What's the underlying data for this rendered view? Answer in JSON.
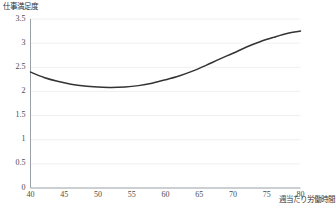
{
  "chart_data": {
    "type": "line",
    "title": "",
    "ylabel": "仕事満足度",
    "xlabel": "週当たり労働時間",
    "xlim": [
      40,
      80
    ],
    "ylim": [
      0,
      3.5
    ],
    "xticks": [
      40,
      45,
      50,
      55,
      60,
      65,
      70,
      75,
      80
    ],
    "xtick_labels": [
      "40",
      "45",
      "50",
      "55",
      "60",
      "65",
      "70",
      "75",
      "80"
    ],
    "yticks": [
      0,
      0.5,
      1,
      1.5,
      2,
      2.5,
      3,
      3.5
    ],
    "ytick_labels": [
      "0",
      "0.5",
      "1",
      "1.5",
      "2",
      "2.5",
      "3",
      "3.5"
    ],
    "grid": true,
    "grid_axis": "y",
    "grid_color": "#e8ecef",
    "legend": false,
    "legend_position": "none",
    "series": [
      {
        "name": "仕事満足度",
        "color": "#333333",
        "line_width": 1.5,
        "x": [
          40,
          42,
          44,
          46,
          48,
          50,
          52,
          54,
          56,
          58,
          60,
          62,
          64,
          66,
          68,
          70,
          72,
          74,
          76,
          78,
          80
        ],
        "values": [
          2.4,
          2.29,
          2.21,
          2.15,
          2.11,
          2.09,
          2.08,
          2.09,
          2.12,
          2.17,
          2.24,
          2.32,
          2.42,
          2.54,
          2.67,
          2.79,
          2.92,
          3.03,
          3.12,
          3.2,
          3.25
        ]
      }
    ]
  },
  "axes": {
    "y_title": "仕事満足度",
    "x_title": "週当たり労働時間"
  },
  "notes": {
    "source_note": ""
  },
  "colors": {
    "line": "#333333",
    "grid": "#e8ecef",
    "axis": "#9aa0a6",
    "text": "#3a3a3a"
  }
}
